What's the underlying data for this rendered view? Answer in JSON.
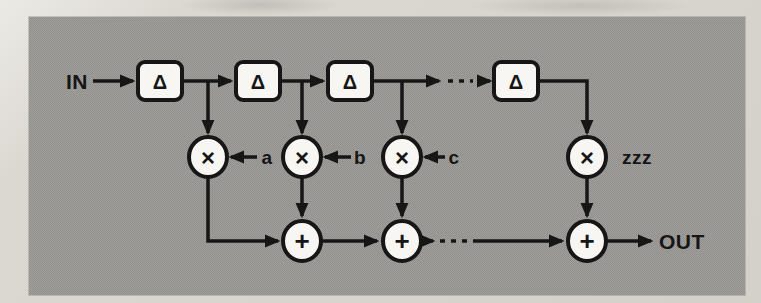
{
  "figure": {
    "kind": "signal-flow-block-diagram",
    "panel_color": "#9a9896",
    "page_color": "#d8d5cf",
    "ink_color": "#161616",
    "node_fill": "#f7f6f2"
  },
  "labels": {
    "input": "IN",
    "output": "OUT",
    "delay": "Δ",
    "multiply": "×",
    "add": "+",
    "coefficients": [
      "a",
      "b",
      "c"
    ],
    "last_coefficient": "zzz"
  },
  "structure": {
    "delay_blocks_visible": 4,
    "multipliers_visible": 4,
    "adders_visible": 3,
    "continuation": "dashed ellipsis between third and final stage on both the delay line and the adder line"
  }
}
